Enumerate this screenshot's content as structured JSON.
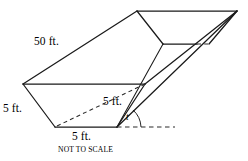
{
  "figure": {
    "note": "NOT TO SCALE",
    "labels": {
      "length": "50 ft.",
      "left_height": "5 ft.",
      "inner_width": "5 ft.",
      "bottom_width": "5 ft.",
      "angle": "t"
    },
    "colors": {
      "stroke": "#1a1a1a",
      "hidden_stroke": "#2a2a2a",
      "background": "#ffffff"
    },
    "geometry": {
      "near_bottom_left": [
        55,
        127
      ],
      "near_bottom_right": [
        117,
        127
      ],
      "near_top_left": [
        23,
        84
      ],
      "near_rim_right": [
        145,
        84
      ],
      "far_top_left": [
        137,
        11
      ],
      "far_top_right": [
        237,
        11
      ],
      "far_bottom_left": [
        163,
        44
      ],
      "far_bottom_right": [
        205,
        44
      ],
      "apex_right": [
        237,
        11
      ],
      "ground_ray_end": [
        175,
        127
      ]
    }
  }
}
